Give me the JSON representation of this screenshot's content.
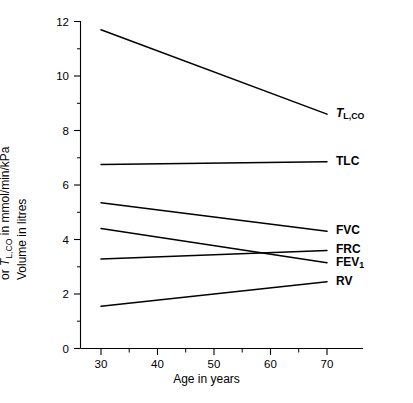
{
  "chart_data": {
    "type": "line",
    "title": "",
    "xlabel": "Age in years",
    "ylabel_line1": "Volume in litres",
    "ylabel_line2_prefix": "or ",
    "ylabel_line2_symbol": "T",
    "ylabel_line2_symbol_sub": "L,CO",
    "ylabel_line2_suffix": " in mmol/min/kPa",
    "ylabel_plain": "Volume in litres or TL,CO in mmol/min/kPa",
    "x": [
      30,
      70
    ],
    "xlim": [
      25,
      75
    ],
    "ylim": [
      0,
      12
    ],
    "xticks": [
      30,
      40,
      50,
      60,
      70
    ],
    "xtick_labels": [
      "30",
      "40",
      "50",
      "60",
      "70"
    ],
    "xticks_minor": [
      35,
      45,
      55,
      65
    ],
    "yticks": [
      0,
      2,
      4,
      6,
      8,
      10,
      12
    ],
    "ytick_labels": [
      "0",
      "2",
      "4",
      "6",
      "8",
      "10",
      "12"
    ],
    "yticks_minor": [
      1,
      3,
      5,
      7,
      9,
      11
    ],
    "grid": false,
    "legend_position": "right-of-lines",
    "series": [
      {
        "name": "TL,CO",
        "label_html": "<tspan class=\"ital\">T</tspan>",
        "label_sub": "L,CO",
        "values": [
          11.7,
          8.6
        ]
      },
      {
        "name": "TLC",
        "label_html": "TLC",
        "label_sub": "",
        "values": [
          6.75,
          6.85
        ]
      },
      {
        "name": "FVC",
        "label_html": "FVC",
        "label_sub": "",
        "values": [
          5.35,
          4.3
        ]
      },
      {
        "name": "FRC",
        "label_html": "FRC",
        "label_sub": "",
        "values": [
          3.28,
          3.6
        ]
      },
      {
        "name": "FEV1",
        "label_html": "FEV",
        "label_sub": "1",
        "values": [
          4.4,
          3.15
        ]
      },
      {
        "name": "RV",
        "label_html": "RV",
        "label_sub": "",
        "values": [
          1.55,
          2.45
        ]
      }
    ],
    "series_label_order": [
      "TL,CO",
      "TLC",
      "FVC",
      "FRC",
      "FEV1",
      "RV"
    ]
  }
}
